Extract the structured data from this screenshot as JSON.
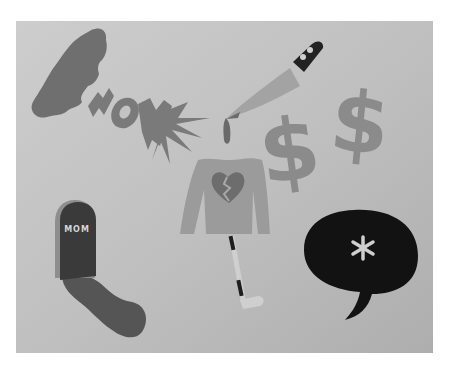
{
  "scene": {
    "description": "Grayscale photo of paper cutout shapes pinned on a gray board",
    "background": "#ffffff",
    "board_color": "#b9b9b9",
    "board_color_light": "#c9c9c9"
  },
  "cutouts": {
    "cloud": {
      "label": "cloud",
      "color": "#6f6f6f"
    },
    "wow": {
      "label": "WOW",
      "color": "#7a7a7a"
    },
    "knife": {
      "label": "knife",
      "blade_color": "#a3a3a3",
      "handle_color": "#222222",
      "rivet_color": "#cfcfcf",
      "blood_color": "#6a6a6a"
    },
    "dollar_signs": [
      {
        "label": "$",
        "color": "#8b8b8b"
      },
      {
        "label": "$",
        "color": "#8b8b8b"
      }
    ],
    "sweater": {
      "label": "sweater",
      "color": "#9b9b9b",
      "heart_color": "#6d6d6d",
      "crack_color": "#a8a8a8"
    },
    "hockey_stick": {
      "label": "hockey stick",
      "color": "#cfcfcf",
      "tape_color": "#1e1e1e"
    },
    "tombstone": {
      "label": "tombstone",
      "text": "MOM",
      "color": "#3a3a3a",
      "text_color": "#d6d6d6",
      "shadow_color": "#555555",
      "edge_color": "#8e8e8e"
    },
    "speech_bubble": {
      "label": "speech bubble",
      "symbol": "*",
      "color": "#121212",
      "symbol_color": "#cfcfcf"
    }
  }
}
